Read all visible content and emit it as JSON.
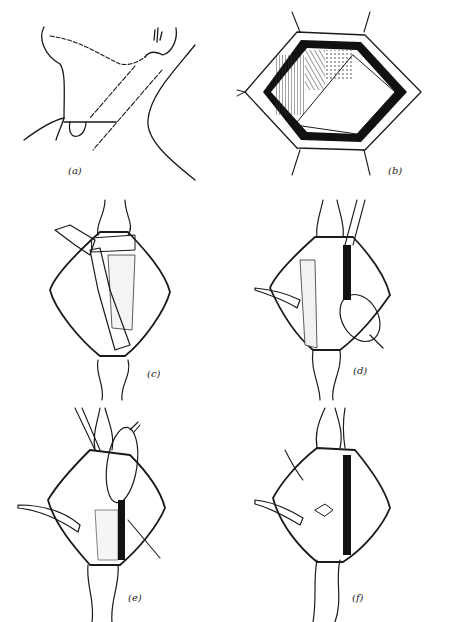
{
  "figure": {
    "colors": {
      "ink": "#1a1a1a",
      "background": "#ffffff",
      "hatch": "#444444"
    },
    "panels": [
      {
        "id": "a",
        "label": "(a)",
        "depiction": "neck outline with incision line"
      },
      {
        "id": "b",
        "label": "(b)",
        "depiction": "hexagonal retracted wound exposing muscle"
      },
      {
        "id": "c",
        "label": "(c)",
        "depiction": "diamond wound with retracted muscle strap"
      },
      {
        "id": "d",
        "label": "(d)",
        "depiction": "diamond wound with retractors, gland exposed"
      },
      {
        "id": "e",
        "label": "(e)",
        "depiction": "diamond wound, gland lifted, vessels ligated"
      },
      {
        "id": "f",
        "label": "(f)",
        "depiction": "diamond wound, closure with sutures"
      }
    ]
  }
}
